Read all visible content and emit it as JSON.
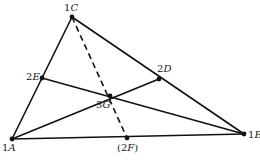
{
  "diagram": {
    "type": "triangle-centroid",
    "colors": {
      "line": "#111111",
      "background": "#ffffff"
    },
    "points": [
      {
        "id": "A",
        "label_num": "1",
        "label_letter": "A",
        "x": 12,
        "y": 139,
        "lx": 2,
        "ly": 151
      },
      {
        "id": "B",
        "label_num": "1",
        "label_letter": "B",
        "x": 244,
        "y": 134,
        "lx": 248,
        "ly": 138
      },
      {
        "id": "C",
        "label_num": "1",
        "label_letter": "C",
        "x": 72,
        "y": 17,
        "lx": 64,
        "ly": 11
      },
      {
        "id": "D",
        "label_num": "2",
        "label_letter": "D",
        "x": 159,
        "y": 79,
        "lx": 157,
        "ly": 72
      },
      {
        "id": "E",
        "label_num": "2",
        "label_letter": "E",
        "x": 42,
        "y": 78,
        "lx": 26,
        "ly": 80
      },
      {
        "id": "F",
        "label_num": "(2",
        "label_letter": "F",
        "label_suffix": ")",
        "x": 127,
        "y": 138,
        "lx": 117,
        "ly": 151
      },
      {
        "id": "G",
        "label_num": "3",
        "label_letter": "G",
        "x": 110,
        "y": 96,
        "lx": 96,
        "ly": 108
      }
    ],
    "segments": [
      {
        "from": "A",
        "to": "B",
        "style": "solid"
      },
      {
        "from": "A",
        "to": "C",
        "style": "solid"
      },
      {
        "from": "C",
        "to": "B",
        "style": "solid"
      },
      {
        "from": "A",
        "to": "D",
        "style": "solid"
      },
      {
        "from": "E",
        "to": "B",
        "style": "solid"
      },
      {
        "from": "C",
        "to": "F",
        "style": "dashed"
      }
    ],
    "labels": {
      "A": "1A",
      "B": "1B",
      "C": "1C",
      "D": "2D",
      "E": "2E",
      "F": "(2F)",
      "G": "3G"
    }
  }
}
